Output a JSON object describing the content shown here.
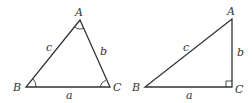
{
  "figures": [
    {
      "name": "general-triangle",
      "vertices": {
        "A": "A",
        "B": "B",
        "C": "C"
      },
      "sides": {
        "a": "a",
        "b": "b",
        "c": "c"
      },
      "angle_marks": [
        "A",
        "B",
        "C"
      ]
    },
    {
      "name": "right-triangle",
      "vertices": {
        "A": "A",
        "B": "B",
        "C": "C"
      },
      "sides": {
        "a": "a",
        "b": "b",
        "c": "c"
      },
      "right_angle_at": "C"
    }
  ]
}
